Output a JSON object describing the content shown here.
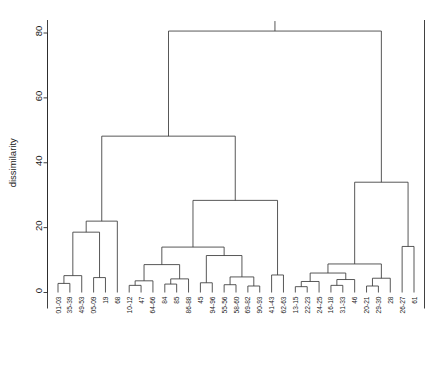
{
  "figure": {
    "title": "",
    "bleed_top_text": "",
    "bleed_bottom_text": ""
  },
  "chart_data": {
    "type": "line",
    "subtype": "dendrogram",
    "title": "",
    "xlabel": "",
    "ylabel": "dissimilarity",
    "ylim": [
      0,
      88
    ],
    "yticks": [
      0,
      20,
      40,
      60,
      80
    ],
    "ytick_labels": [
      "0",
      "20",
      "40",
      "60",
      "80"
    ],
    "grid": false,
    "legend": null,
    "orientation": "vertical",
    "leaf_label_rotation": 90,
    "n_leaves": 32,
    "categories": [
      "01-03",
      "35-39",
      "49-53",
      "05-09",
      "19",
      "68",
      "10-12",
      "47",
      "64-66",
      "84",
      "85",
      "86-88",
      "45",
      "94-96",
      "55-56",
      "58-60",
      "69-82",
      "90-93",
      "41-43",
      "62-63",
      "13-15",
      "22-23",
      "24-25",
      "16-18",
      "31-33",
      "46",
      "20-21",
      "29-30",
      "28",
      "26-27",
      "61"
    ],
    "leaves": [
      {
        "index": 0,
        "label": "01-03"
      },
      {
        "index": 1,
        "label": "35-39"
      },
      {
        "index": 2,
        "label": "49-53"
      },
      {
        "index": 3,
        "label": "05-09"
      },
      {
        "index": 4,
        "label": "19"
      },
      {
        "index": 5,
        "label": "68"
      },
      {
        "index": 6,
        "label": "10-12"
      },
      {
        "index": 7,
        "label": "47"
      },
      {
        "index": 8,
        "label": "64-66"
      },
      {
        "index": 9,
        "label": "84"
      },
      {
        "index": 10,
        "label": "85"
      },
      {
        "index": 11,
        "label": "86-88"
      },
      {
        "index": 12,
        "label": "45"
      },
      {
        "index": 13,
        "label": "94-96"
      },
      {
        "index": 14,
        "label": "55-56"
      },
      {
        "index": 15,
        "label": "58-60"
      },
      {
        "index": 16,
        "label": "69-82"
      },
      {
        "index": 17,
        "label": "90-93"
      },
      {
        "index": 18,
        "label": "41-43"
      },
      {
        "index": 19,
        "label": "62-63"
      },
      {
        "index": 20,
        "label": "13-15"
      },
      {
        "index": 21,
        "label": "22-23"
      },
      {
        "index": 22,
        "label": "24-25"
      },
      {
        "index": 23,
        "label": "16-18"
      },
      {
        "index": 24,
        "label": "31-33"
      },
      {
        "index": 25,
        "label": "46"
      },
      {
        "index": 26,
        "label": "20-21"
      },
      {
        "index": 27,
        "label": "29-30"
      },
      {
        "index": 28,
        "label": "28"
      },
      {
        "index": 29,
        "label": "26-27"
      },
      {
        "index": 30,
        "label": "61"
      }
    ],
    "merges": [
      {
        "id": "m1",
        "left": "01-03",
        "right": "35-39",
        "height": 2.8
      },
      {
        "id": "m2",
        "left": "m1",
        "right": "49-53",
        "height": 5.2
      },
      {
        "id": "m3",
        "left": "05-09",
        "right": "19",
        "height": 4.6
      },
      {
        "id": "m4",
        "left": "m2",
        "right": "m3",
        "height": 18.6
      },
      {
        "id": "m5",
        "left": "m4",
        "right": "68",
        "height": 22.0
      },
      {
        "id": "m6",
        "left": "10-12",
        "right": "47",
        "height": 2.2
      },
      {
        "id": "m7",
        "left": "m6",
        "right": "64-66",
        "height": 3.6
      },
      {
        "id": "m8",
        "left": "84",
        "right": "85",
        "height": 2.6
      },
      {
        "id": "m9",
        "left": "m8",
        "right": "86-88",
        "height": 4.2
      },
      {
        "id": "m10",
        "left": "m7",
        "right": "m9",
        "height": 8.6
      },
      {
        "id": "m11",
        "left": "45",
        "right": "94-96",
        "height": 3.0
      },
      {
        "id": "m12",
        "left": "55-56",
        "right": "58-60",
        "height": 2.4
      },
      {
        "id": "m13",
        "left": "69-82",
        "right": "90-93",
        "height": 2.0
      },
      {
        "id": "m14",
        "left": "m12",
        "right": "m13",
        "height": 4.8
      },
      {
        "id": "m15",
        "left": "m11",
        "right": "m14",
        "height": 11.4
      },
      {
        "id": "m16",
        "left": "m10",
        "right": "m15",
        "height": 14.0
      },
      {
        "id": "m17",
        "left": "41-43",
        "right": "62-63",
        "height": 5.4
      },
      {
        "id": "m18",
        "left": "m16",
        "right": "m17",
        "height": 28.4
      },
      {
        "id": "m19",
        "left": "m5",
        "right": "m18",
        "height": 48.2
      },
      {
        "id": "m20",
        "left": "13-15",
        "right": "22-23",
        "height": 1.8
      },
      {
        "id": "m21",
        "left": "m20",
        "right": "24-25",
        "height": 3.4
      },
      {
        "id": "m22",
        "left": "16-18",
        "right": "31-33",
        "height": 2.2
      },
      {
        "id": "m23",
        "left": "m22",
        "right": "46",
        "height": 4.0
      },
      {
        "id": "m24",
        "left": "m21",
        "right": "m23",
        "height": 6.0
      },
      {
        "id": "m25",
        "left": "20-21",
        "right": "29-30",
        "height": 2.0
      },
      {
        "id": "m26",
        "left": "m25",
        "right": "28",
        "height": 4.4
      },
      {
        "id": "m27",
        "left": "m24",
        "right": "m26",
        "height": 8.8
      },
      {
        "id": "m28",
        "left": "26-27",
        "right": "61",
        "height": 14.2
      },
      {
        "id": "m29",
        "left": "m27",
        "right": "m28",
        "height": 34.0
      },
      {
        "id": "m30",
        "left": "m19",
        "right": "m29",
        "height": 80.6
      }
    ]
  },
  "axes": {
    "y_title": "dissimilarity"
  }
}
